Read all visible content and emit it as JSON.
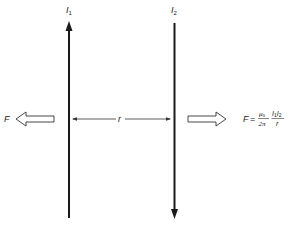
{
  "diagram": {
    "wires": [
      {
        "label": "I",
        "subscript": "1",
        "direction": "up"
      },
      {
        "label": "I",
        "subscript": "2",
        "direction": "down"
      }
    ],
    "separation_label": "r",
    "force_left_label": "F",
    "formula": {
      "lhs": "F",
      "equals": "=",
      "frac1_num": "μ",
      "frac1_num_sub": "0",
      "frac1_den": "2π",
      "frac2_num_a": "I",
      "frac2_num_a_sub": "1",
      "frac2_num_b": "I",
      "frac2_num_b_sub": "2",
      "frac2_den": "r"
    },
    "colors": {
      "line": "#1a1a1a",
      "text": "#222222",
      "background": "#ffffff"
    }
  }
}
